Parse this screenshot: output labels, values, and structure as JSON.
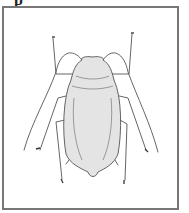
{
  "figure": {
    "label_fragment": "p",
    "colors": {
      "frame": "#777777",
      "body_fill": "#e4e4e4",
      "outline": "#555555"
    }
  }
}
